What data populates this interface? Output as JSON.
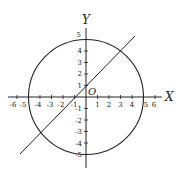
{
  "diagram": {
    "type": "coordinate-plane",
    "axes": {
      "x_label": "X",
      "y_label": "Y",
      "origin_label": "O",
      "x_ticks": [
        "-6",
        "-5",
        "-4",
        "-3",
        "-2",
        "-1",
        "1",
        "2",
        "3",
        "4",
        "5",
        "6"
      ],
      "y_ticks": [
        "5",
        "4",
        "3",
        "2",
        "1",
        "-1",
        "-2",
        "-3",
        "-4",
        "-5"
      ]
    },
    "circle": {
      "center": [
        0,
        0
      ],
      "radius": 5
    },
    "line": {
      "description": "line y = x + 1 intersecting circle at (3,4) and (-4,-3)"
    },
    "colors": {
      "stroke": "#222222",
      "background": "#ffffff"
    }
  }
}
